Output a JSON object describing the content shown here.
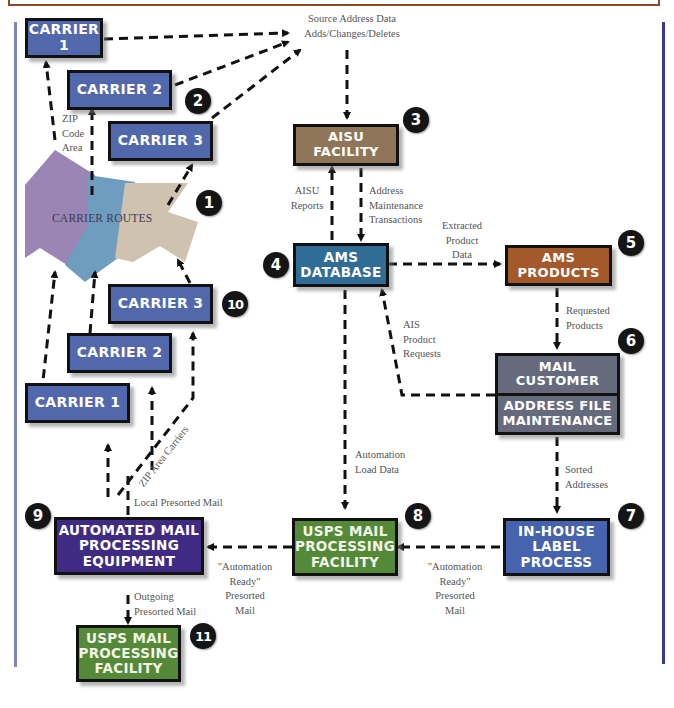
{
  "diagram": {
    "colors": {
      "carrier": "#5268ad",
      "aisu_facility": "#8f7658",
      "ams_database": "#2f6d97",
      "ams_products": "#a4592b",
      "mail_customer": "#656b7d",
      "inhouse_label": "#4663ae",
      "usps_facility": "#55893a",
      "automated_equipment": "#3f2b84",
      "route_purple": "#9a85b4",
      "route_blue": "#6f9dc0",
      "route_tan": "#cfc2ae",
      "frame_top": "#8b4a2a",
      "frame_right": "#3c3a8e",
      "frame_left": "#7d86b8"
    },
    "nodes": {
      "carrier1_top": "CARRIER 1",
      "carrier2_top": "CARRIER 2",
      "carrier3_top": "CARRIER 3",
      "carrier_routes": "CARRIER ROUTES",
      "aisu_facility": "AISU\nFACILITY",
      "ams_database": "AMS\nDATABASE",
      "ams_products": "AMS\nPRODUCTS",
      "mail_customer": "MAIL\nCUSTOMER",
      "address_file_maintenance": "ADDRESS FILE\nMAINTENANCE",
      "inhouse_label_process": "IN-HOUSE\nLABEL\nPROCESS",
      "usps_facility_8": "USPS MAIL\nPROCESSING\nFACILITY",
      "automated_equipment": "AUTOMATED MAIL\nPROCESSING\nEQUIPMENT",
      "usps_facility_11": "USPS MAIL\nPROCESSING\nFACILITY",
      "carrier3_bottom": "CARRIER 3",
      "carrier2_bottom": "CARRIER 2",
      "carrier1_bottom": "CARRIER 1"
    },
    "badges": [
      "1",
      "2",
      "3",
      "4",
      "5",
      "6",
      "7",
      "8",
      "9",
      "10",
      "11"
    ],
    "labels": {
      "source_address": "Source Address Data\nAdds/Changes/Deletes",
      "zip_code_area": "ZIP\nCode\nArea",
      "aisu_reports": "AISU\nReports",
      "address_maintenance": "Address\nMaintenance\nTransactions",
      "extracted_product_data": "Extracted\nProduct\nData",
      "requested_products": "Requested\nProducts",
      "ais_product_requests": "AIS\nProduct\nRequests",
      "automation_load_data": "Automation\nLoad Data",
      "sorted_addresses": "Sorted\nAddresses",
      "automation_ready_right": "\"Automation\nReady\"\nPresorted\nMail",
      "automation_ready_left": "\"Automation\nReady\"\nPresorted\nMail",
      "local_presorted_mail": "Local Presorted Mail",
      "zip_area_carriers": "ZIP Area Carriers",
      "outgoing_presorted_mail": "Outgoing\nPresorted Mail"
    }
  }
}
